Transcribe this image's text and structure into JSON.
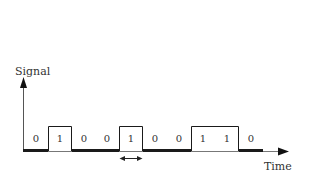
{
  "diagram": {
    "y_axis_label": "Signal",
    "x_axis_label": "Time",
    "bits": [
      "0",
      "1",
      "0",
      "0",
      "1",
      "0",
      "0",
      "1",
      "1",
      "0"
    ],
    "bit_width_indicator": "double-arrow-icon",
    "colors": {
      "line": "#1a1a1a",
      "axis": "#555555",
      "text": "#333333",
      "background": "#ffffff"
    }
  }
}
